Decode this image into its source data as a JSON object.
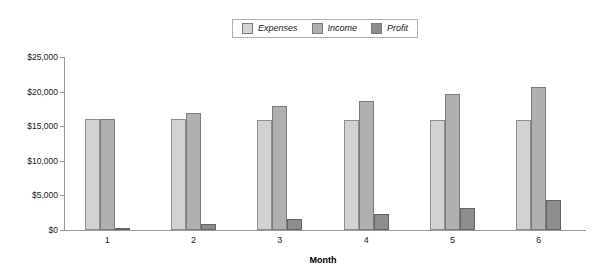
{
  "chart_data": {
    "type": "bar",
    "title": "",
    "subtitle": "",
    "xlabel": "Month",
    "ylabel": "",
    "categories": [
      "1",
      "2",
      "3",
      "4",
      "5",
      "6"
    ],
    "series": [
      {
        "name": "Expenses",
        "color": "#d2d2d2",
        "values": [
          16000,
          16000,
          15900,
          15900,
          15900,
          15900
        ]
      },
      {
        "name": "Income",
        "color": "#b0b0b0",
        "values": [
          16100,
          16900,
          17900,
          18700,
          19700,
          20600
        ]
      },
      {
        "name": "Profit",
        "color": "#8d8d8d",
        "values": [
          200,
          900,
          1600,
          2300,
          3200,
          4400
        ]
      }
    ],
    "ylim": [
      0,
      25000
    ],
    "ytick_values": [
      0,
      5000,
      10000,
      15000,
      20000,
      25000
    ],
    "ytick_labels": [
      "$0",
      "$5,000",
      "$10,000",
      "$15,000",
      "$20,000",
      "$25,000"
    ],
    "grid": false,
    "legend_position": "top-center"
  },
  "legend": {
    "items": [
      {
        "label": "Expenses",
        "color": "#d2d2d2"
      },
      {
        "label": "Income",
        "color": "#b0b0b0"
      },
      {
        "label": "Profit",
        "color": "#8d8d8d"
      }
    ]
  }
}
